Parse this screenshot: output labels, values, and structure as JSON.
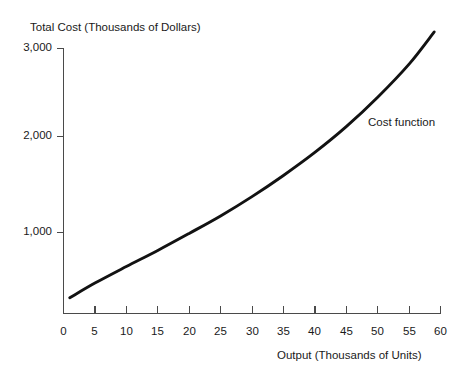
{
  "chart_data": {
    "type": "line",
    "title": "",
    "xlabel": "Output (Thousands of Units)",
    "ylabel": "Total Cost (Thousands of Dollars)",
    "xlim": [
      0,
      60
    ],
    "ylim": [
      0,
      3000
    ],
    "grid": false,
    "legend_position": "inline-annotation",
    "xticks": [
      0,
      5,
      10,
      15,
      20,
      25,
      30,
      35,
      40,
      45,
      50,
      55,
      60
    ],
    "xtick_labels": [
      "0",
      "5",
      "10",
      "15",
      "20",
      "25",
      "30",
      "35",
      "40",
      "45",
      "50",
      "55",
      "60"
    ],
    "yticks": [
      1000,
      2000,
      3000
    ],
    "ytick_labels": [
      "1,000",
      "2,000",
      "3,000"
    ],
    "annotations": [
      {
        "text": "Cost function",
        "x": 47,
        "y": 2020
      }
    ],
    "series": [
      {
        "name": "Cost function",
        "color": "#121212",
        "x": [
          1,
          5,
          10,
          15,
          20,
          25,
          30,
          35,
          40,
          45,
          50,
          55,
          59
        ],
        "values": [
          290,
          450,
          630,
          805,
          990,
          1180,
          1390,
          1620,
          1870,
          2150,
          2470,
          2830,
          3180
        ]
      }
    ]
  },
  "labels": {
    "y_axis_title": "Total Cost (Thousands of Dollars)",
    "x_axis_title": "Output (Thousands of Units)",
    "curve_annotation": "Cost function",
    "y_tick_3000": "3,000",
    "y_tick_2000": "2,000",
    "y_tick_1000": "1,000",
    "x_tick_0": "0",
    "x_tick_5": "5",
    "x_tick_10": "10",
    "x_tick_15": "15",
    "x_tick_20": "20",
    "x_tick_25": "25",
    "x_tick_30": "30",
    "x_tick_35": "35",
    "x_tick_40": "40",
    "x_tick_45": "45",
    "x_tick_50": "50",
    "x_tick_55": "55",
    "x_tick_60": "60"
  },
  "colors": {
    "curve": "#121212",
    "axis": "#4a4a4a",
    "text": "#1a1a1a",
    "background": "#ffffff"
  }
}
